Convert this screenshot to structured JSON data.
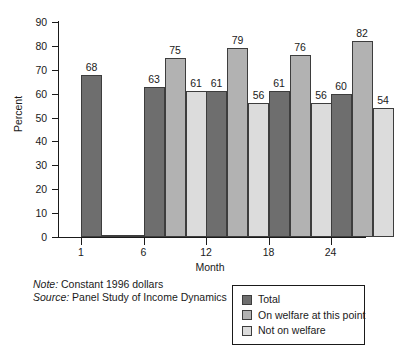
{
  "chart_data": {
    "type": "bar",
    "title": "",
    "xlabel": "Month",
    "ylabel": "Percent",
    "categories": [
      "1",
      "6",
      "12",
      "18",
      "24"
    ],
    "series": [
      {
        "name": "Total",
        "color": "#6e6e6e",
        "values": [
          68,
          63,
          61,
          61,
          60
        ]
      },
      {
        "name": "On welfare at this point",
        "color": "#b2b2b2",
        "values": [
          0,
          75,
          79,
          76,
          82
        ]
      },
      {
        "name": "Not on welfare",
        "color": "#dcdcdc",
        "values": [
          0,
          61,
          56,
          56,
          54
        ]
      }
    ],
    "value_labels": [
      [
        "68",
        "",
        ""
      ],
      [
        "63",
        "75",
        "61"
      ],
      [
        "61",
        "79",
        "56"
      ],
      [
        "61",
        "76",
        "56"
      ],
      [
        "60",
        "82",
        "54"
      ]
    ],
    "ylim": [
      0,
      90
    ],
    "yticks": [
      0,
      10,
      20,
      30,
      40,
      50,
      60,
      70,
      80,
      90
    ],
    "ytick_labels": [
      "0",
      "10",
      "20",
      "30",
      "40",
      "50",
      "60",
      "70",
      "80",
      "90"
    ],
    "grid": false,
    "legend_position": "bottom-right"
  },
  "notes": {
    "note_label": "Note:",
    "note_text": "Constant 1996 dollars",
    "source_label": "Source:",
    "source_text": "Panel Study of Income Dynamics"
  },
  "legend": {
    "items": [
      {
        "label": "Total",
        "color": "#6e6e6e"
      },
      {
        "label": "On welfare at this point",
        "color": "#b2b2b2"
      },
      {
        "label": "Not on welfare",
        "color": "#dcdcdc"
      }
    ]
  }
}
